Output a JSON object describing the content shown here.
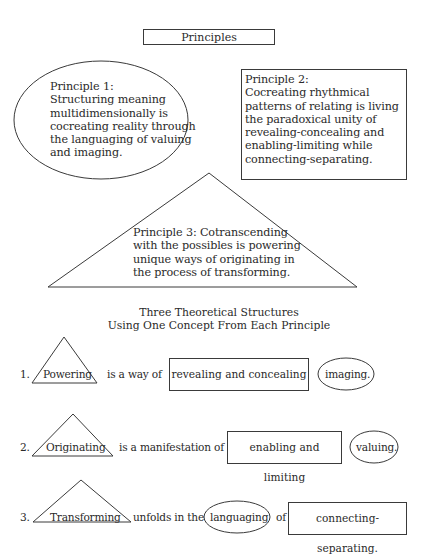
{
  "title": "Principles",
  "principles": [
    {
      "label": "Principle 1:",
      "shape": "ellipse",
      "lines": [
        "Structuring meaning",
        "multidimensionally is",
        "cocreating reality through",
        "the languaging of valuing",
        "and imaging."
      ]
    },
    {
      "label": "Principle 2:",
      "shape": "rectangle",
      "lines": [
        "Cocreating rhythmical",
        "patterns of relating is living",
        "the paradoxical unity of",
        "revealing-concealing and",
        "enabling-limiting while",
        "connecting-separating."
      ]
    },
    {
      "label": "Principle 3:",
      "shape": "triangle",
      "lines": [
        "Principle 3: Cotranscending",
        "with the possibles is powering",
        "unique ways of originating in",
        "the process of transforming."
      ]
    }
  ],
  "structures_heading": {
    "line1": "Three Theoretical Structures",
    "line2": "Using One Concept From Each Principle"
  },
  "structures": [
    {
      "number": "1.",
      "triangle_concept": "Powering",
      "connector": "is a way of",
      "rectangle_concept": "revealing and concealing",
      "ellipse_concept": "imaging."
    },
    {
      "number": "2.",
      "triangle_concept": "Originating",
      "connector": "is a manifestation of",
      "rectangle_concept": "enabling and limiting",
      "ellipse_concept": "valuing."
    },
    {
      "number": "3.",
      "triangle_concept": "Transforming",
      "connector": "unfolds in the",
      "ellipse_concept": "languaging",
      "connector2": "of",
      "rectangle_concept": "connecting-separating."
    }
  ]
}
